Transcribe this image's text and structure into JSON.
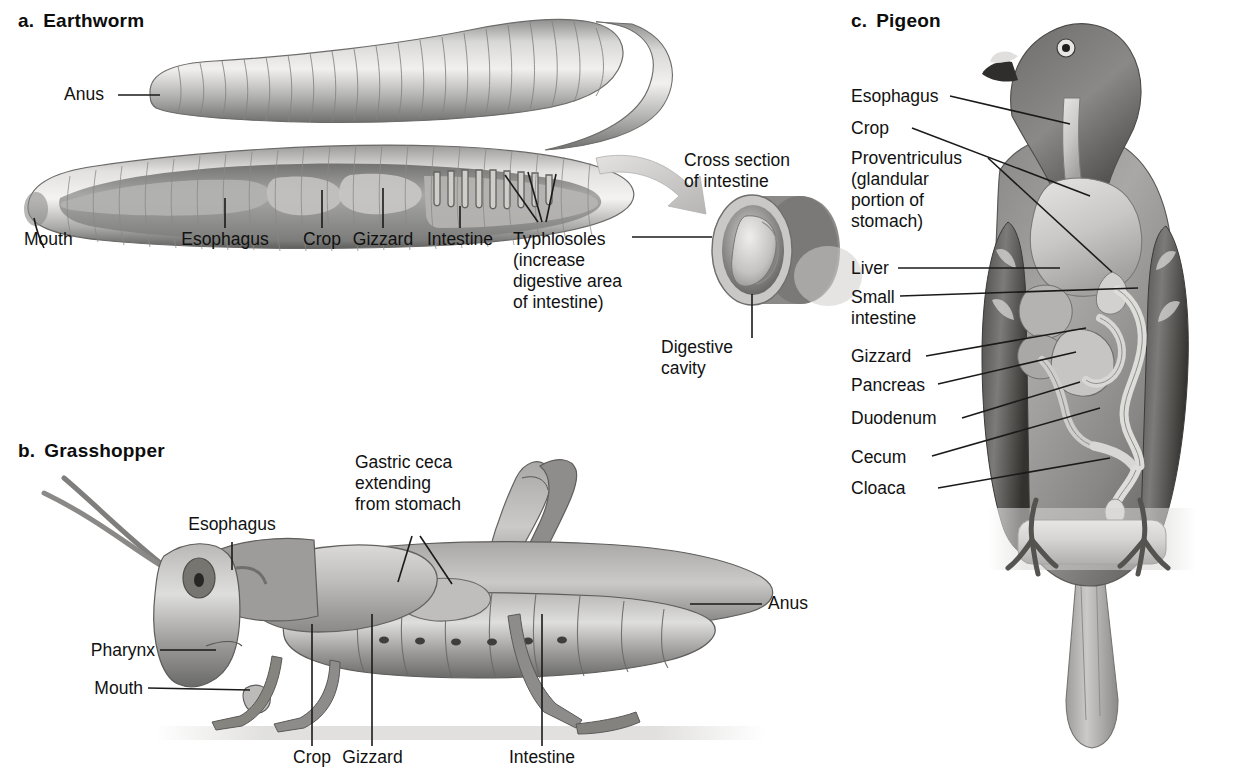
{
  "figure": {
    "background": "#ffffff",
    "ink": "#111111"
  },
  "panels": [
    {
      "id": "earthworm",
      "letter": "a.",
      "title": "Earthworm",
      "labels": [
        {
          "name": "anus",
          "text": "Anus"
        },
        {
          "name": "mouth",
          "text": "Mouth"
        },
        {
          "name": "esophagus",
          "text": "Esophagus"
        },
        {
          "name": "crop",
          "text": "Crop"
        },
        {
          "name": "gizzard",
          "text": "Gizzard"
        },
        {
          "name": "intestine",
          "text": "Intestine"
        },
        {
          "name": "typhlosoles",
          "text": "Typhlosoles"
        },
        {
          "name": "typhlosoles-note-1",
          "text": "(increase"
        },
        {
          "name": "typhlosoles-note-2",
          "text": "digestive area"
        },
        {
          "name": "typhlosoles-note-3",
          "text": "of intestine)"
        },
        {
          "name": "cross-section-1",
          "text": "Cross section"
        },
        {
          "name": "cross-section-2",
          "text": "of intestine"
        },
        {
          "name": "digestive-cavity-1",
          "text": "Digestive"
        },
        {
          "name": "digestive-cavity-2",
          "text": "cavity"
        }
      ]
    },
    {
      "id": "grasshopper",
      "letter": "b.",
      "title": "Grasshopper",
      "labels": [
        {
          "name": "esophagus",
          "text": "Esophagus"
        },
        {
          "name": "gastric-ceca-1",
          "text": "Gastric ceca"
        },
        {
          "name": "gastric-ceca-2",
          "text": "extending"
        },
        {
          "name": "gastric-ceca-3",
          "text": "from stomach"
        },
        {
          "name": "pharynx",
          "text": "Pharynx"
        },
        {
          "name": "mouth",
          "text": "Mouth"
        },
        {
          "name": "anus",
          "text": "Anus"
        },
        {
          "name": "crop",
          "text": "Crop"
        },
        {
          "name": "gizzard",
          "text": "Gizzard"
        },
        {
          "name": "intestine",
          "text": "Intestine"
        }
      ]
    },
    {
      "id": "pigeon",
      "letter": "c.",
      "title": "Pigeon",
      "labels": [
        {
          "name": "esophagus",
          "text": "Esophagus"
        },
        {
          "name": "crop",
          "text": "Crop"
        },
        {
          "name": "proventriculus-1",
          "text": "Proventriculus"
        },
        {
          "name": "proventriculus-2",
          "text": "(glandular"
        },
        {
          "name": "proventriculus-3",
          "text": "portion of"
        },
        {
          "name": "proventriculus-4",
          "text": "stomach)"
        },
        {
          "name": "liver",
          "text": "Liver"
        },
        {
          "name": "small-intestine-1",
          "text": "Small"
        },
        {
          "name": "small-intestine-2",
          "text": "intestine"
        },
        {
          "name": "gizzard",
          "text": "Gizzard"
        },
        {
          "name": "pancreas",
          "text": "Pancreas"
        },
        {
          "name": "duodenum",
          "text": "Duodenum"
        },
        {
          "name": "cecum",
          "text": "Cecum"
        },
        {
          "name": "cloaca",
          "text": "Cloaca"
        }
      ]
    }
  ]
}
